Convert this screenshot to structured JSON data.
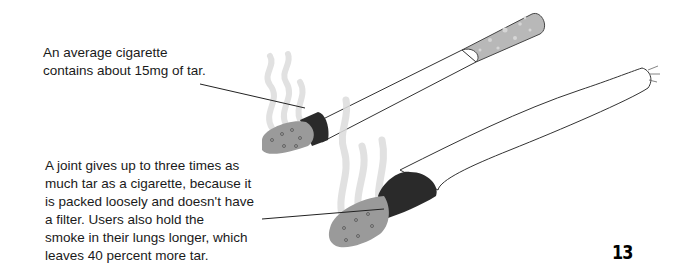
{
  "page": {
    "page_number": "13"
  },
  "captions": {
    "cigarette": {
      "lines": [
        "An average cigarette",
        "contains about 15mg of tar."
      ]
    },
    "joint": {
      "lines": [
        "A joint gives up to three times as",
        "much tar as a cigarette, because it",
        "is packed loosely and doesn't have",
        "a filter. Users also hold the",
        "smoke in their lungs longer, which",
        "leaves 40 percent more tar."
      ]
    }
  },
  "illustrations": {
    "cigarette": {
      "label": "cigarette-illustration",
      "filter_color": "#b5b5b5",
      "paper_color": "#ffffff",
      "ash_color": "#9a9a9a",
      "ember_color": "#2a2a2a"
    },
    "joint": {
      "label": "joint-illustration",
      "paper_color": "#ffffff",
      "ash_color": "#9a9a9a",
      "ember_color": "#2a2a2a"
    },
    "smoke_color": "#d8d8d8"
  }
}
